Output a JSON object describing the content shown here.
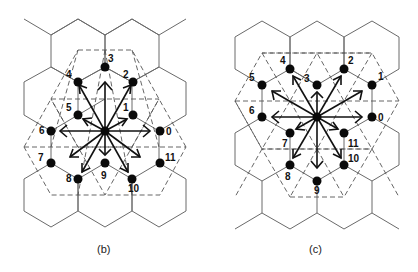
{
  "figure": {
    "panels": [
      {
        "id": "b",
        "caption": "(b)",
        "center": [
          105,
          131
        ],
        "node_labels": [
          "0",
          "1",
          "2",
          "3",
          "4",
          "5",
          "6",
          "7",
          "8",
          "9",
          "10",
          "11"
        ],
        "nodes": [
          [
            160,
            131
          ],
          [
            133,
            115
          ],
          [
            133,
            82
          ],
          [
            105,
            67
          ],
          [
            78,
            82
          ],
          [
            78,
            115
          ],
          [
            51,
            131
          ],
          [
            51,
            163
          ],
          [
            78,
            179
          ],
          [
            105,
            163
          ],
          [
            132,
            179
          ],
          [
            160,
            163
          ]
        ],
        "label_offsets": [
          [
            6,
            4
          ],
          [
            -10,
            -4
          ],
          [
            -10,
            -4
          ],
          [
            3,
            -5
          ],
          [
            -12,
            -4
          ],
          [
            -12,
            -4
          ],
          [
            -12,
            3
          ],
          [
            -13,
            -2
          ],
          [
            -12,
            3
          ],
          [
            -4,
            16
          ],
          [
            -4,
            13
          ],
          [
            5,
            -2
          ]
        ]
      },
      {
        "id": "c",
        "caption": "(c)",
        "center": [
          317,
          117
        ],
        "node_labels": [
          "0",
          "1",
          "2",
          "3",
          "4",
          "5",
          "6",
          "7",
          "8",
          "9",
          "10",
          "11"
        ],
        "nodes": [
          [
            372,
            117
          ],
          [
            372,
            85
          ],
          [
            344,
            69
          ],
          [
            317,
            85
          ],
          [
            290,
            69
          ],
          [
            262,
            85
          ],
          [
            262,
            117
          ],
          [
            290,
            133
          ],
          [
            290,
            165
          ],
          [
            317,
            181
          ],
          [
            344,
            165
          ],
          [
            344,
            133
          ]
        ],
        "label_offsets": [
          [
            6,
            4
          ],
          [
            6,
            -5
          ],
          [
            4,
            -5
          ],
          [
            -13,
            -3
          ],
          [
            -10,
            -5
          ],
          [
            -13,
            -4
          ],
          [
            -13,
            -3
          ],
          [
            -8,
            14
          ],
          [
            -5,
            15
          ],
          [
            -3,
            13
          ],
          [
            4,
            -3
          ],
          [
            4,
            14
          ]
        ]
      }
    ]
  }
}
